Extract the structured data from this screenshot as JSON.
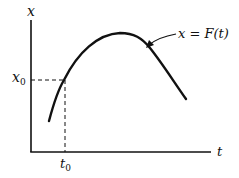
{
  "figure": {
    "type": "function graph",
    "axes": {
      "vertical_label": "x",
      "horizontal_label": "t"
    },
    "marked_point": {
      "x_label_main": "x",
      "x_label_sub": "0",
      "t_label_main": "t",
      "t_label_sub": "0"
    },
    "curve": {
      "label": "x = F(t)",
      "shape": "concave-down arch rising from lower left, peaking near center, descending to lower right"
    },
    "colors": {
      "ink": "#111111",
      "background": "#ffffff"
    }
  }
}
